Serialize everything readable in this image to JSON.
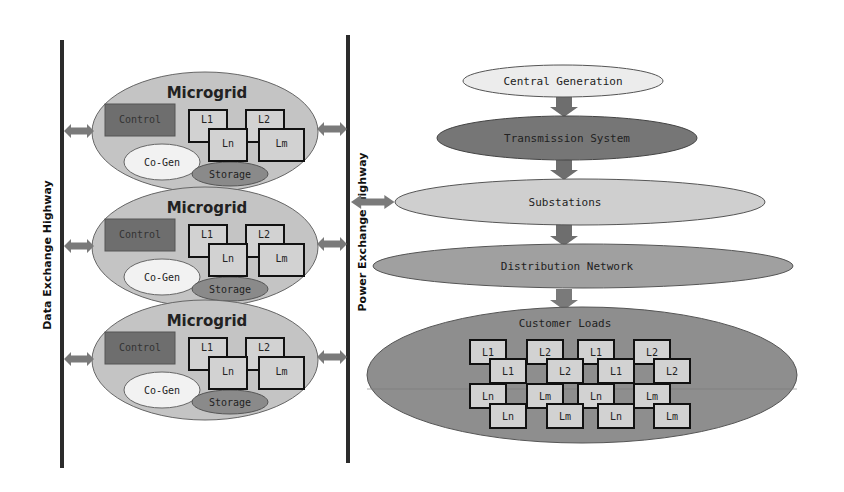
{
  "colors": {
    "highway": "#2b2b2b",
    "arrow": "#7a7a7a",
    "microgrid_fill": "#c4c4c4",
    "control_fill": "#6e6e6e",
    "cogen_fill": "#f2f2f2",
    "storage_fill": "#8a8a8a",
    "load_fill": "#d2d2d2",
    "central_fill": "#ececec",
    "transmission_fill": "#767676",
    "substations_fill": "#cfcfcf",
    "distribution_fill": "#a0a0a0",
    "customer_fill": "#8e8e8e"
  },
  "highways": {
    "data": "Data Exchange Highway",
    "power": "Power Exchange Highway"
  },
  "microgrids": [
    {
      "title": "Microgrid",
      "control": "Control",
      "cogen": "Co-Gen",
      "storage": "Storage",
      "loads": [
        "L1",
        "L2",
        "Ln",
        "Lm"
      ]
    },
    {
      "title": "Microgrid",
      "control": "Control",
      "cogen": "Co-Gen",
      "storage": "Storage",
      "loads": [
        "L1",
        "L2",
        "Ln",
        "Lm"
      ]
    },
    {
      "title": "Microgrid",
      "control": "Control",
      "cogen": "Co-Gen",
      "storage": "Storage",
      "loads": [
        "L1",
        "L2",
        "Ln",
        "Lm"
      ]
    }
  ],
  "hierarchy": {
    "central_generation": "Central Generation",
    "transmission": "Transmission System",
    "substations": "Substations",
    "distribution": "Distribution Network",
    "customer_loads": "Customer Loads"
  },
  "customer_grid": [
    [
      "L1",
      "L2",
      "L1",
      "L2"
    ],
    [
      "L1",
      "L2",
      "L1",
      "L2"
    ],
    [
      "Ln",
      "Lm",
      "Ln",
      "Lm"
    ],
    [
      "Ln",
      "Lm",
      "Ln",
      "Lm"
    ]
  ]
}
